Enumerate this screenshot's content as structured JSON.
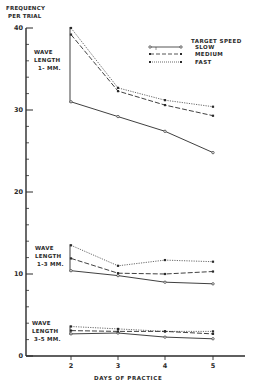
{
  "chart_data": {
    "type": "line",
    "title": "",
    "ylabel": "FREQUENCY PER TRIAL",
    "xlabel": "DAYS OF PRACTICE",
    "x": [
      2,
      3,
      4,
      5
    ],
    "xticks": [
      "2",
      "3",
      "4",
      "5"
    ],
    "yticks": [
      "0",
      "10",
      "20",
      "30",
      "40"
    ],
    "ylim": [
      0,
      40
    ],
    "grid": false,
    "legend": {
      "title": "TARGET SPEED",
      "position": "upper right",
      "entries": [
        "SLOW",
        "MEDIUM",
        "FAST"
      ]
    },
    "groups": [
      {
        "label": [
          "WAVE",
          "LENGTH",
          "1- MM."
        ],
        "series": [
          {
            "name": "SLOW",
            "style": "solid",
            "marker": "open",
            "values": [
              31.0,
              29.2,
              27.4,
              24.8
            ]
          },
          {
            "name": "MEDIUM",
            "style": "dashed",
            "marker": "filled",
            "values": [
              39.2,
              32.3,
              30.6,
              29.3
            ]
          },
          {
            "name": "FAST",
            "style": "dotted",
            "marker": "filled",
            "values": [
              40.0,
              32.7,
              31.2,
              30.4
            ]
          }
        ]
      },
      {
        "label": [
          "WAVE",
          "LENGTH",
          "1-3 MM."
        ],
        "series": [
          {
            "name": "SLOW",
            "style": "solid",
            "marker": "open",
            "values": [
              10.4,
              9.8,
              9.0,
              8.8
            ]
          },
          {
            "name": "MEDIUM",
            "style": "dashed",
            "marker": "filled",
            "values": [
              11.9,
              10.1,
              10.0,
              10.3
            ]
          },
          {
            "name": "FAST",
            "style": "dotted",
            "marker": "filled",
            "values": [
              13.5,
              11.0,
              11.7,
              11.5
            ]
          }
        ]
      },
      {
        "label": [
          "WAVE",
          "LENGTH",
          "3-5 MM."
        ],
        "series": [
          {
            "name": "SLOW",
            "style": "solid",
            "marker": "open",
            "values": [
              2.7,
              2.8,
              2.3,
              2.1
            ]
          },
          {
            "name": "MEDIUM",
            "style": "dashed",
            "marker": "filled",
            "values": [
              3.1,
              3.0,
              3.0,
              2.7
            ]
          },
          {
            "name": "FAST",
            "style": "dotted",
            "marker": "filled",
            "values": [
              3.6,
              3.3,
              3.0,
              3.0
            ]
          }
        ]
      }
    ]
  },
  "labels": {
    "ylabel_line1": "FREQUENCY",
    "ylabel_line2": "PER TRIAL",
    "xlabel": "DAYS OF PRACTICE",
    "legend_title": "TARGET SPEED",
    "legend_slow": "SLOW",
    "legend_medium": "MEDIUM",
    "legend_fast": "FAST",
    "group1": [
      "WAVE",
      "LENGTH",
      "1- MM."
    ],
    "group2": [
      "WAVE",
      "LENGTH",
      "1-3 MM."
    ],
    "group3": [
      "WAVE",
      "LENGTH",
      "3-5 MM."
    ]
  },
  "colors": {
    "ink": "#2a2a2a",
    "background": "#ffffff"
  }
}
